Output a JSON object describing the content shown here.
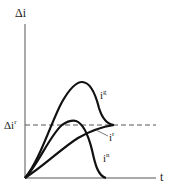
{
  "diagram": {
    "y_axis_label": "Δi",
    "x_axis_label": "t",
    "reference_line": {
      "label_base": "Δi",
      "label_sup": "r",
      "style": "dashed"
    },
    "curves": [
      {
        "id": "ig",
        "label_base": "i",
        "label_sup": "g",
        "description": "large transient peak returning to reference level"
      },
      {
        "id": "ir",
        "label_base": "i",
        "label_sup": "r",
        "description": "monotonic rise approaching reference level"
      },
      {
        "id": "in",
        "label_base": "i",
        "label_sup": "n",
        "description": "transient pulse rising to reference level then decaying to zero"
      }
    ],
    "colors": {
      "line": "#1a1a1a",
      "background": "#ffffff"
    }
  }
}
